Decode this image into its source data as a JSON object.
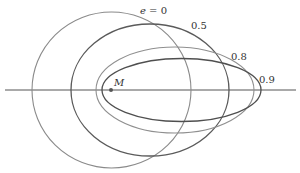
{
  "diagram": {
    "axis": {
      "x1": 5,
      "x2": 296,
      "y": 90,
      "color": "#555555"
    },
    "focus": {
      "label": "M",
      "cx": 111,
      "cy": 90,
      "color": "#555555"
    },
    "orbits": [
      {
        "eccentricity": "0",
        "label": "e = 0",
        "cx": 111.5,
        "cy": 90,
        "rx": 79.5,
        "ry": 78,
        "color": "#8a8a8a",
        "width": 1.1,
        "label_x": 140,
        "label_y": 14
      },
      {
        "eccentricity": "0.5",
        "label": "0.5",
        "cx": 150,
        "cy": 90,
        "rx": 79,
        "ry": 66,
        "color": "#5a5a5a",
        "width": 1.3,
        "label_x": 191,
        "label_y": 29
      },
      {
        "eccentricity": "0.8",
        "label": "0.8",
        "cx": 175,
        "cy": 90,
        "rx": 79,
        "ry": 43,
        "color": "#8f8f8f",
        "width": 1.1,
        "label_x": 231,
        "label_y": 60
      },
      {
        "eccentricity": "0.9",
        "label": "0.9",
        "cx": 181.5,
        "cy": 90,
        "rx": 79.5,
        "ry": 31.5,
        "color": "#4f4f4f",
        "width": 1.3,
        "label_x": 259,
        "label_y": 83
      }
    ]
  }
}
